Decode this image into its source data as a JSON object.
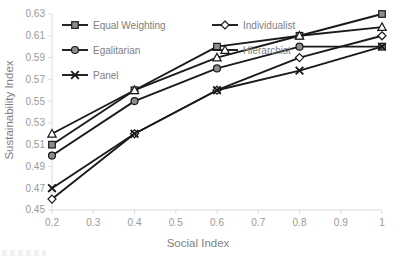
{
  "chart_data": {
    "type": "line",
    "title": "",
    "xlabel": "Social Index",
    "ylabel": "Sustainability Index",
    "x": [
      0.2,
      0.4,
      0.6,
      0.8,
      1.0
    ],
    "xlim": [
      0.2,
      1.0
    ],
    "ylim": [
      0.45,
      0.63
    ],
    "xticks": [
      "0.2",
      "0.3",
      "0.4",
      "0.5",
      "0.6",
      "0.7",
      "0.8",
      "0.9",
      "1"
    ],
    "xtick_values": [
      0.2,
      0.3,
      0.4,
      0.5,
      0.6,
      0.7,
      0.8,
      0.9,
      1.0
    ],
    "yticks": [
      "0.45",
      "0.47",
      "0.49",
      "0.51",
      "0.53",
      "0.55",
      "0.57",
      "0.59",
      "0.61",
      "0.63"
    ],
    "ytick_values": [
      0.45,
      0.47,
      0.49,
      0.51,
      0.53,
      0.55,
      0.57,
      0.59,
      0.61,
      0.63
    ],
    "grid": false,
    "legend_position": "top-left-inside",
    "line_color": "#1a1a1a",
    "marker_fill_gray": "#8c8c8c",
    "marker_fill_open": "#ffffff",
    "series": [
      {
        "name": "Equal Weighting",
        "marker": "square",
        "marker_style": "filled-gray",
        "values": [
          0.51,
          0.56,
          0.6,
          0.61,
          0.63
        ]
      },
      {
        "name": "Individualist",
        "marker": "diamond",
        "marker_style": "open",
        "values": [
          0.46,
          0.52,
          0.56,
          0.59,
          0.61
        ]
      },
      {
        "name": "Egalitarian",
        "marker": "circle",
        "marker_style": "filled-gray",
        "values": [
          0.5,
          0.55,
          0.58,
          0.6,
          0.6
        ]
      },
      {
        "name": "Hierarchist",
        "marker": "triangle",
        "marker_style": "open",
        "values": [
          0.52,
          0.56,
          0.59,
          0.61,
          0.618
        ]
      },
      {
        "name": "Panel",
        "marker": "cross",
        "marker_style": "cross",
        "values": [
          0.47,
          0.52,
          0.56,
          0.578,
          0.6
        ]
      }
    ],
    "legend_layout": [
      {
        "series_index": 0,
        "column": 0,
        "row": 0
      },
      {
        "series_index": 1,
        "column": 1,
        "row": 0
      },
      {
        "series_index": 2,
        "column": 0,
        "row": 1
      },
      {
        "series_index": 3,
        "column": 1,
        "row": 1
      },
      {
        "series_index": 4,
        "column": 0,
        "row": 2
      }
    ]
  }
}
